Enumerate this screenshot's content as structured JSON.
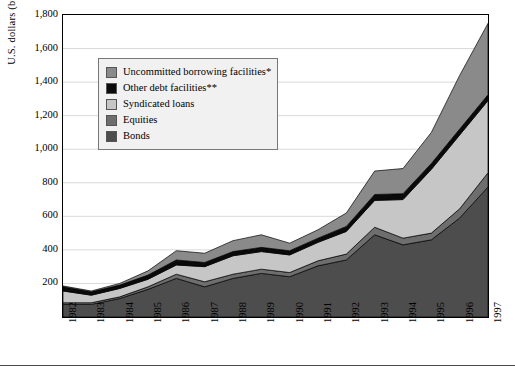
{
  "axes": {
    "ylabel": "U.S. dollars (billions)",
    "yticks": [
      "1,800",
      "1,600",
      "1,400",
      "1,200",
      "1,000",
      "800",
      "600",
      "400",
      "200"
    ],
    "xlabel": ""
  },
  "legend": {
    "items": [
      {
        "label": "Uncommitted borrowing facilities*",
        "color": "#8a8a8a",
        "icon": "legend-swatch-icon"
      },
      {
        "label": "Other debt facilities**",
        "color": "#0a0a0a",
        "icon": "legend-swatch-icon"
      },
      {
        "label": "Syndicated loans",
        "color": "#c6c6c6",
        "icon": "legend-swatch-icon"
      },
      {
        "label": "Equities",
        "color": "#6e6e6e",
        "icon": "legend-swatch-icon"
      },
      {
        "label": "Bonds",
        "color": "#4d4d4d",
        "icon": "legend-swatch-icon"
      }
    ]
  },
  "footnote": "",
  "chart_data": {
    "type": "area",
    "stacked": true,
    "title": "",
    "xlabel": "",
    "ylabel": "U.S. dollars (billions)",
    "ylim": [
      0,
      1800
    ],
    "ytick_step": 200,
    "grid": true,
    "legend_position": "upper-left-inset",
    "categories": [
      "1982",
      "1983",
      "1984",
      "1985",
      "1986",
      "1987",
      "1988",
      "1989",
      "1990",
      "1991",
      "1992",
      "1993",
      "1994",
      "1995",
      "1996",
      "1997"
    ],
    "series": [
      {
        "name": "Bonds",
        "color": "#4d4d4d",
        "values": [
          75,
          75,
          110,
          165,
          230,
          180,
          230,
          260,
          240,
          305,
          340,
          490,
          430,
          460,
          590,
          775
        ]
      },
      {
        "name": "Equities",
        "color": "#6e6e6e",
        "values": [
          10,
          10,
          10,
          15,
          25,
          30,
          25,
          25,
          25,
          30,
          35,
          45,
          40,
          40,
          55,
          85
        ]
      },
      {
        "name": "Syndicated loans",
        "color": "#c6c6c6",
        "values": [
          70,
          45,
          50,
          45,
          55,
          90,
          110,
          105,
          105,
          110,
          135,
          160,
          230,
          380,
          440,
          430
        ]
      },
      {
        "name": "Other debt facilities**",
        "color": "#0a0a0a",
        "values": [
          25,
          20,
          20,
          25,
          30,
          25,
          25,
          25,
          25,
          25,
          30,
          35,
          35,
          35,
          35,
          35
        ]
      },
      {
        "name": "Uncommitted borrowing facilities*",
        "color": "#8a8a8a",
        "values": [
          5,
          5,
          10,
          25,
          55,
          55,
          65,
          75,
          45,
          50,
          80,
          140,
          150,
          185,
          320,
          425
        ]
      }
    ],
    "totals": [
      185,
      155,
      200,
      275,
      395,
      380,
      455,
      490,
      440,
      520,
      620,
      870,
      885,
      1100,
      1440,
      1750
    ]
  }
}
